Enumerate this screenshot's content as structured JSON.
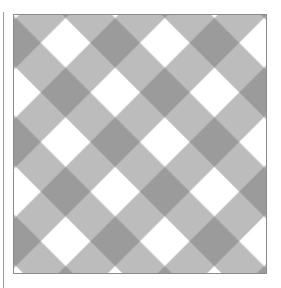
{
  "image": {
    "description": "Diagonal gingham checkered pattern in grayscale inside a bordered square",
    "colors": {
      "light": "#ffffff",
      "mid": "#b4b4b4",
      "dark": "#999999",
      "border": "#8a8a8a"
    },
    "pattern": {
      "type": "diagonal-gingham",
      "cell_period_px": 50,
      "rotation_deg": 45
    }
  }
}
